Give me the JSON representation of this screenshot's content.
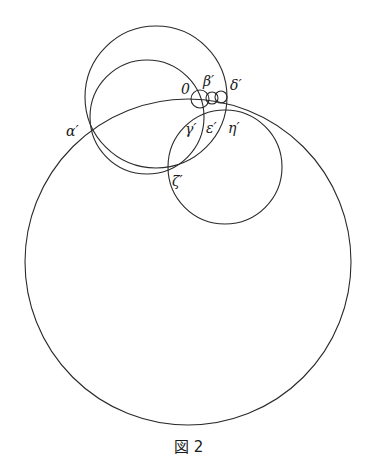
{
  "figure": {
    "caption": "図 2",
    "stroke_color": "#2a2a2a",
    "background": "#ffffff"
  },
  "labels": {
    "origin": "0",
    "alpha": "α′",
    "beta": "β′",
    "gamma": "γ′",
    "delta": "δ′",
    "epsilon": "ε′",
    "zeta": "ζ′",
    "eta": "η′"
  },
  "circles": [
    {
      "name": "large-circle",
      "cx": 188,
      "cy": 262,
      "r": 163
    },
    {
      "name": "upper-outer-circle",
      "cx": 156,
      "cy": 97,
      "r": 71
    },
    {
      "name": "upper-inner-circle",
      "cx": 147,
      "cy": 117,
      "r": 57
    },
    {
      "name": "lower-right-circle",
      "cx": 225,
      "cy": 167,
      "r": 57
    },
    {
      "name": "small-circle-beta",
      "cx": 200,
      "cy": 99,
      "r": 9
    },
    {
      "name": "small-circle-epsilon",
      "cx": 212,
      "cy": 98,
      "r": 6
    },
    {
      "name": "small-circle-eta",
      "cx": 221,
      "cy": 97,
      "r": 6
    }
  ]
}
